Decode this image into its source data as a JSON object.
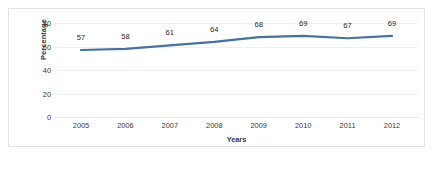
{
  "chart_data": {
    "type": "line",
    "title": "",
    "categories": [
      "2005",
      "2006",
      "2007",
      "2008",
      "2009",
      "2010",
      "2011",
      "2012"
    ],
    "values": [
      57,
      58,
      61,
      64,
      68,
      69,
      67,
      69
    ],
    "series": [
      {
        "name": "Percentage",
        "values": [
          57,
          58,
          61,
          64,
          68,
          69,
          67,
          69
        ],
        "color": "#4472A4"
      }
    ],
    "xlabel": "Years",
    "ylabel": "Percentage",
    "ylim": [
      0,
      80
    ],
    "yticks": [
      0,
      20,
      40,
      60,
      80
    ],
    "ytick_labels": [
      "0",
      "20",
      "40",
      "60",
      "80"
    ],
    "data_labels": [
      "57",
      "58",
      "61",
      "64",
      "68",
      "69",
      "67",
      "69"
    ],
    "grid": true,
    "grid_axis": "y",
    "legend": false,
    "markers": false
  },
  "caption": {
    "text": ""
  },
  "colors": {
    "line": "#4472A4",
    "grid": "#eceff3",
    "frame": "#e2e2e2",
    "text": "#3a3a3a",
    "label_text": "#262626",
    "background": "#ffffff"
  }
}
